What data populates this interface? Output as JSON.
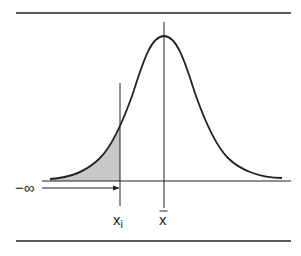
{
  "diagram": {
    "type": "normal-distribution-cumulative-area",
    "labels": {
      "neg_infinity": "−∞",
      "x_i": "x",
      "x_i_sub": "i",
      "mean": "x"
    },
    "colors": {
      "ink": "#222222",
      "shade": "#c8c8c8",
      "background": "#ffffff"
    }
  }
}
